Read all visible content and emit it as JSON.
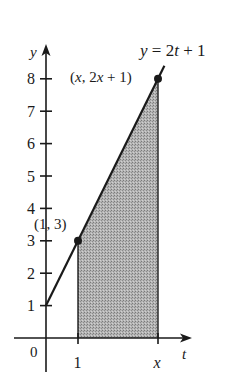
{
  "diagram": {
    "type": "area-under-line",
    "function_label": "y = 2t + 1",
    "function": {
      "slope": 2,
      "intercept": 1
    },
    "axes": {
      "x_label": "t",
      "y_label": "y",
      "origin_label": "0",
      "x_ticks": [
        {
          "value": 1,
          "label": "1"
        },
        {
          "value": 5,
          "label": "x"
        }
      ],
      "y_ticks": [
        {
          "value": 1,
          "label": "1"
        },
        {
          "value": 2,
          "label": "2"
        },
        {
          "value": 3,
          "label": "3"
        },
        {
          "value": 4,
          "label": "4"
        },
        {
          "value": 5,
          "label": "5"
        },
        {
          "value": 6,
          "label": "6"
        },
        {
          "value": 7,
          "label": "7"
        },
        {
          "value": 8,
          "label": "8"
        }
      ]
    },
    "points": [
      {
        "name": "start-point",
        "t": 1,
        "y": 3,
        "label": "(1, 3)"
      },
      {
        "name": "end-point",
        "t": 3.5,
        "y": 8,
        "label": "(x, 2x + 1)"
      }
    ],
    "shaded_region": {
      "from_t": 1,
      "to_t": "x",
      "under": "y = 2t + 1"
    },
    "colors": {
      "ink": "#1a1a1a",
      "shade": "#a8a8a8"
    }
  }
}
